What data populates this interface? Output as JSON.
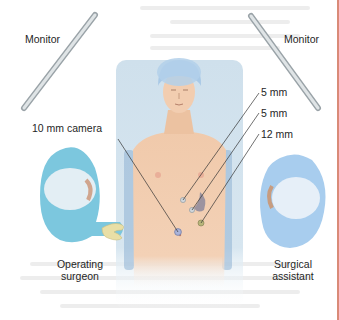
{
  "figure": {
    "labels": {
      "monitor_left": "Monitor",
      "monitor_right": "Monitor",
      "camera": "10 mm camera",
      "port_1": "5 mm",
      "port_2": "5 mm",
      "port_3": "12 mm",
      "surgeon_line1": "Operating",
      "surgeon_line2": "surgeon",
      "assistant_line1": "Surgical",
      "assistant_line2": "assistant"
    },
    "colors": {
      "drape": "#cfe0ec",
      "skin": "#f2cdb0",
      "cap": "#a9c9e6",
      "surgeon_gown": "#7cc7de",
      "assistant_gown": "#a8cdee",
      "monitor": "#c9cfd2",
      "page_edge": "#d98a78"
    }
  }
}
